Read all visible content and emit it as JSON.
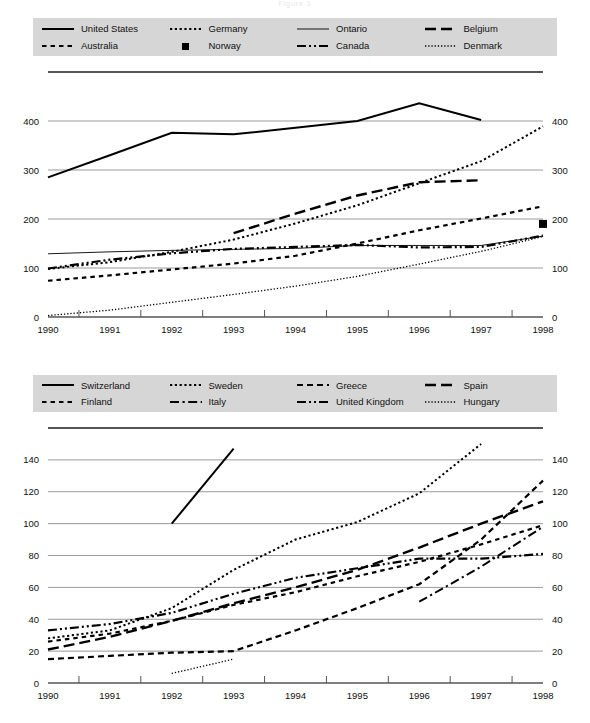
{
  "figure": {
    "title": "Figure 1",
    "legend_bg": "#d6d6d6",
    "line_color": "#000000",
    "grid_color": "#9a9a9a"
  },
  "panels": [
    {
      "id": "panel-top",
      "legend": [
        {
          "label": "United States",
          "style": "solid",
          "swatch": "solid"
        },
        {
          "label": "Germany",
          "style": "dotted-med",
          "swatch": "dotted-med"
        },
        {
          "label": "Ontario",
          "style": "thin-solid",
          "swatch": "thin-solid"
        },
        {
          "label": "Belgium",
          "style": "dashed-long",
          "swatch": "dashed-long"
        },
        {
          "label": "Australia",
          "style": "dashed-pair",
          "swatch": "dashed-pair"
        },
        {
          "label": "Norway",
          "style": "marker",
          "swatch": "marker"
        },
        {
          "label": "Canada",
          "style": "dash-dot-dot",
          "swatch": "dash-dot-dot"
        },
        {
          "label": "Denmark",
          "style": "dotted-fine",
          "swatch": "dotted-fine"
        }
      ],
      "chart_data": {
        "type": "line",
        "title": "",
        "xlabel": "",
        "ylabel": "",
        "x": [
          1990,
          1991,
          1992,
          1993,
          1994,
          1995,
          1996,
          1997,
          1998
        ],
        "xlim": [
          1990,
          1998
        ],
        "ylim": [
          0,
          500
        ],
        "yticks": [
          0,
          100,
          200,
          300,
          400
        ],
        "ytick_labels": [
          "0",
          "100",
          "200",
          "300",
          "400"
        ],
        "xtick_labels": [
          "1990",
          "1991",
          "1992",
          "1993",
          "1994",
          "1995",
          "1996",
          "1997",
          "1998"
        ],
        "grid": true,
        "legend_position": "top",
        "dual_y_axis": true,
        "series": [
          {
            "name": "United States",
            "style": "solid",
            "x": [
              1990,
              1991,
              1992,
              1993,
              1994,
              1995,
              1996,
              1997
            ],
            "values": [
              285,
              330,
              376,
              373,
              386,
              400,
              436,
              402
            ]
          },
          {
            "name": "Germany",
            "style": "dotted-med",
            "x": [
              1990,
              1991,
              1992,
              1993,
              1994,
              1995,
              1996,
              1997,
              1998
            ],
            "values": [
              98,
              112,
              133,
              158,
              191,
              228,
              273,
              318,
              389
            ]
          },
          {
            "name": "Ontario",
            "style": "thin-solid",
            "x": [
              1990,
              1991,
              1992,
              1993,
              1994,
              1995,
              1996,
              1997,
              1998
            ],
            "values": [
              129,
              133,
              136,
              138,
              140,
              146,
              146,
              146,
              165
            ]
          },
          {
            "name": "Belgium",
            "style": "dashed-long",
            "x": [
              1993,
              1994,
              1995,
              1996,
              1997
            ],
            "values": [
              171,
              211,
              248,
              275,
              279
            ]
          },
          {
            "name": "Australia",
            "style": "dashed-pair",
            "x": [
              1990,
              1991,
              1992,
              1993,
              1994,
              1995,
              1996,
              1997,
              1998
            ],
            "values": [
              74,
              85,
              97,
              109,
              125,
              150,
              177,
              201,
              226
            ]
          },
          {
            "name": "Norway",
            "style": "marker",
            "x": [
              1998
            ],
            "values": [
              190
            ]
          },
          {
            "name": "Canada",
            "style": "dash-dot-dot",
            "x": [
              1990,
              1991,
              1992,
              1993,
              1994,
              1995,
              1996,
              1997,
              1998
            ],
            "values": [
              99,
              117,
              130,
              139,
              143,
              147,
              142,
              143,
              166
            ]
          },
          {
            "name": "Denmark",
            "style": "dotted-fine",
            "x": [
              1990,
              1991,
              1992,
              1993,
              1994,
              1995,
              1996,
              1997,
              1998
            ],
            "values": [
              3,
              14,
              30,
              46,
              63,
              83,
              108,
              134,
              164
            ]
          }
        ]
      }
    },
    {
      "id": "panel-bottom",
      "legend": [
        {
          "label": "Switzerland",
          "style": "solid",
          "swatch": "solid"
        },
        {
          "label": "Sweden",
          "style": "dotted-med",
          "swatch": "dotted-med"
        },
        {
          "label": "Greece",
          "style": "dashed-short",
          "swatch": "dashed-short"
        },
        {
          "label": "Spain",
          "style": "dashed-long",
          "swatch": "dashed-long"
        },
        {
          "label": "Finland",
          "style": "dashed-pair",
          "swatch": "dashed-pair"
        },
        {
          "label": "Italy",
          "style": "dash-dot",
          "swatch": "dash-dot"
        },
        {
          "label": "United Kingdom",
          "style": "dash-dot-dot",
          "swatch": "dash-dot-dot"
        },
        {
          "label": "Hungary",
          "style": "dotted-fine",
          "swatch": "dotted-fine"
        }
      ],
      "chart_data": {
        "type": "line",
        "title": "",
        "xlabel": "",
        "ylabel": "",
        "x": [
          1990,
          1991,
          1992,
          1993,
          1994,
          1995,
          1996,
          1997,
          1998
        ],
        "xlim": [
          1990,
          1998
        ],
        "ylim": [
          0,
          160
        ],
        "yticks": [
          0,
          20,
          40,
          60,
          80,
          100,
          120,
          140
        ],
        "ytick_labels": [
          "0",
          "20",
          "40",
          "60",
          "80",
          "100",
          "120",
          "140"
        ],
        "xtick_labels": [
          "1990",
          "1991",
          "1992",
          "1993",
          "1994",
          "1995",
          "1996",
          "1997",
          "1998"
        ],
        "grid": true,
        "legend_position": "top",
        "dual_y_axis": true,
        "series": [
          {
            "name": "Switzerland",
            "style": "solid",
            "x": [
              1992,
              1993
            ],
            "values": [
              100,
              147
            ]
          },
          {
            "name": "Sweden",
            "style": "dotted-med",
            "x": [
              1990,
              1991,
              1992,
              1993,
              1994,
              1995,
              1996,
              1997
            ],
            "values": [
              28,
              33,
              47,
              71,
              90,
              101,
              119,
              150
            ]
          },
          {
            "name": "Greece",
            "style": "dashed-short",
            "x": [
              1990,
              1991,
              1992,
              1993,
              1994,
              1995,
              1996,
              1997,
              1998
            ],
            "values": [
              15,
              17,
              19,
              20,
              33,
              47,
              62,
              90,
              127
            ]
          },
          {
            "name": "Spain",
            "style": "dashed-long",
            "x": [
              1990,
              1991,
              1992,
              1993,
              1994,
              1995,
              1996,
              1997,
              1998
            ],
            "values": [
              21,
              29,
              39,
              50,
              60,
              71,
              85,
              100,
              114
            ]
          },
          {
            "name": "Finland",
            "style": "dashed-pair",
            "x": [
              1990,
              1991,
              1992,
              1993,
              1994,
              1995,
              1996,
              1997,
              1998
            ],
            "values": [
              26,
              31,
              39,
              49,
              57,
              67,
              76,
              87,
              99
            ]
          },
          {
            "name": "Italy",
            "style": "dash-dot",
            "x": [
              1996,
              1997,
              1998
            ],
            "values": [
              51,
              73,
              98
            ]
          },
          {
            "name": "United Kingdom",
            "style": "dash-dot-dot",
            "x": [
              1990,
              1991,
              1992,
              1993,
              1994,
              1995,
              1996,
              1997,
              1998
            ],
            "values": [
              33,
              37,
              44,
              56,
              66,
              72,
              78,
              78,
              81
            ]
          },
          {
            "name": "Hungary",
            "style": "dotted-fine",
            "x": [
              1992,
              1993
            ],
            "values": [
              6,
              15
            ]
          }
        ]
      }
    }
  ]
}
